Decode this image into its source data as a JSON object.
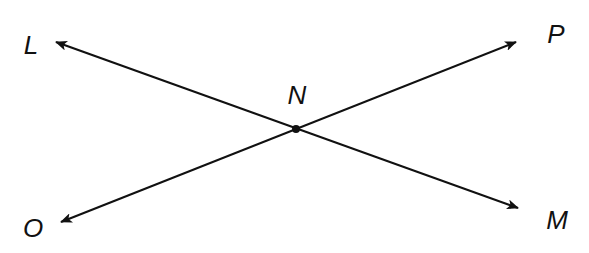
{
  "diagram": {
    "point": {
      "label": "N",
      "x": 296,
      "y": 129
    },
    "lines": [
      {
        "name": "line-LM",
        "from": {
          "x": 56,
          "y": 42
        },
        "to": {
          "x": 518,
          "y": 208
        }
      },
      {
        "name": "line-OP",
        "from": {
          "x": 61,
          "y": 222
        },
        "to": {
          "x": 516,
          "y": 42
        }
      }
    ],
    "labels": [
      {
        "text": "L",
        "x": 31,
        "y": 45
      },
      {
        "text": "P",
        "x": 556,
        "y": 34
      },
      {
        "text": "N",
        "x": 297,
        "y": 95
      },
      {
        "text": "O",
        "x": 33,
        "y": 228
      },
      {
        "text": "M",
        "x": 557,
        "y": 220
      }
    ],
    "stroke_color": "#111111"
  }
}
